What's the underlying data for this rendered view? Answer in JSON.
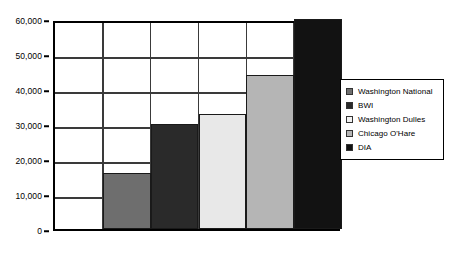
{
  "chart_data": {
    "type": "bar",
    "title": "",
    "xlabel": "",
    "ylabel": "",
    "categories": [
      "Washington National",
      "BWI",
      "Washington Dulles",
      "Chicago O'Hare",
      "DIA"
    ],
    "values": [
      16000,
      30000,
      33000,
      44000,
      60000
    ],
    "ylim": [
      0,
      60000
    ],
    "yticks": [
      0,
      10000,
      20000,
      30000,
      40000,
      50000,
      60000
    ],
    "ytick_labels": [
      "0",
      "10,000",
      "20,000",
      "30,000",
      "40,000",
      "50,000",
      "60,000"
    ],
    "grid": true,
    "legend_position": "right",
    "series": [
      {
        "name": "Airports",
        "values": [
          16000,
          30000,
          33000,
          44000,
          60000
        ]
      }
    ],
    "bar_colors": [
      "#6e6e6e",
      "#2a2a2a",
      "#e8e8e8",
      "#b5b5b5",
      "#121212"
    ],
    "bar_border_color": "#1a1a1a",
    "axis_color": "#000000",
    "gridline_color": "#3a3a3a",
    "background_color": "#ffffff",
    "n_slots": 6,
    "first_slot_empty": true
  },
  "legend": {
    "items": [
      {
        "label": "Washington National",
        "color": "#6e6e6e"
      },
      {
        "label": "BWI",
        "color": "#2a2a2a"
      },
      {
        "label": "Washington Dulles",
        "color": "#f2f2f2"
      },
      {
        "label": "Chicago O'Hare",
        "color": "#b5b5b5"
      },
      {
        "label": "DIA",
        "color": "#121212"
      }
    ]
  }
}
